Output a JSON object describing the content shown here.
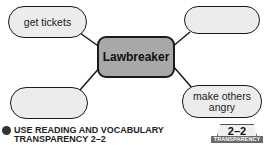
{
  "diagram": {
    "type": "concept-web",
    "center": {
      "label": "Lawbreaker"
    },
    "nodes": [
      {
        "position": "top-left",
        "label": "get tickets"
      },
      {
        "position": "top-right",
        "label": ""
      },
      {
        "position": "bottom-left",
        "label": ""
      },
      {
        "position": "bottom-right",
        "label": "make others angry"
      }
    ],
    "colors": {
      "center_fill": "#a8a8a8",
      "node_fill": "#ececec",
      "stroke": "#1a1a1a"
    }
  },
  "footer": {
    "instruction_line1": "USE READING AND VOCABULARY",
    "instruction_line2": "TRANSPARENCY 2–2"
  },
  "badge": {
    "number": "2–2",
    "label": "TRANSPARENCY"
  }
}
